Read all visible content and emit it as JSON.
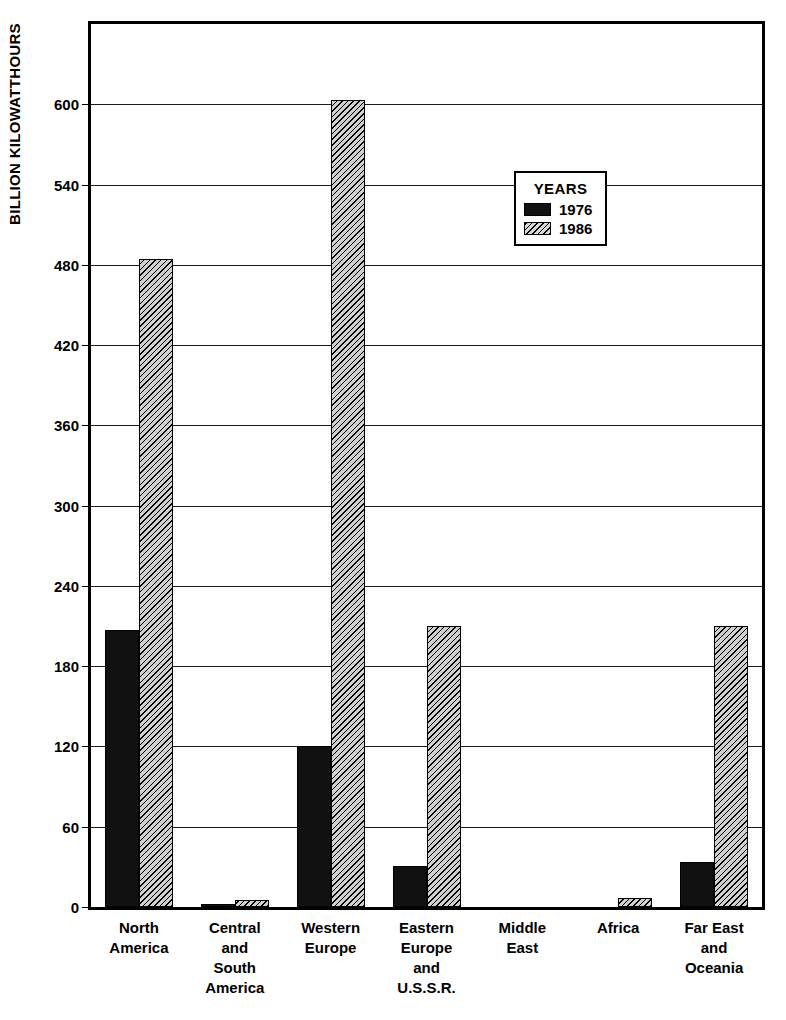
{
  "chart_data": {
    "type": "bar",
    "title": "",
    "xlabel": "",
    "ylabel": "BILLION KILOWATTHOURS",
    "ylim": [
      0,
      660
    ],
    "ytick_values": [
      0,
      60,
      120,
      180,
      240,
      300,
      360,
      420,
      480,
      540,
      600
    ],
    "ytick_labels": [
      "0",
      "60",
      "120",
      "180",
      "240",
      "300",
      "360",
      "420",
      "480",
      "540",
      "600"
    ],
    "grid": true,
    "legend_position": "inside-upper-right",
    "legend_title": "YEARS",
    "categories": [
      "North\nAmerica",
      "Central\nand\nSouth\nAmerica",
      "Western\nEurope",
      "Eastern\nEurope\nand\nU.S.S.R.",
      "Middle\nEast",
      "Africa",
      "Far East\nand\nOceania"
    ],
    "category_lines": [
      [
        "North",
        "America"
      ],
      [
        "Central",
        "and",
        "South",
        "America"
      ],
      [
        "Western",
        "Europe"
      ],
      [
        "Eastern",
        "Europe",
        "and",
        "U.S.S.R."
      ],
      [
        "Middle",
        "East"
      ],
      [
        "Africa"
      ],
      [
        "Far East",
        "and",
        "Oceania"
      ]
    ],
    "series": [
      {
        "name": "1976",
        "color": "#111111",
        "pattern": "solid",
        "values": [
          207,
          2,
          120,
          31,
          0,
          0,
          34
        ]
      },
      {
        "name": "1986",
        "color": "#d0d0d0",
        "pattern": "diagonal-hatch",
        "values": [
          484,
          5,
          603,
          210,
          0,
          7,
          210
        ]
      }
    ]
  },
  "legend": {
    "title": "YEARS",
    "entries": [
      {
        "label": "1976",
        "swatch": "solid-black"
      },
      {
        "label": "1986",
        "swatch": "diagonal-hatch"
      }
    ]
  },
  "axis": {
    "y_title": "BILLION KILOWATTHOURS"
  }
}
